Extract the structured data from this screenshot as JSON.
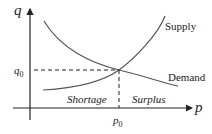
{
  "diagram": {
    "type": "supply-demand",
    "axes": {
      "y_label": "q",
      "x_label": "p"
    },
    "equilibrium": {
      "q_label": "q",
      "q_sub": "0",
      "p_label": "p",
      "p_sub": "0"
    },
    "curves": [
      {
        "name": "Supply"
      },
      {
        "name": "Demand"
      }
    ],
    "regions": {
      "left": "Shortage",
      "right": "Surplus"
    },
    "colors": {
      "axis": "#222222",
      "curve": "#555555"
    }
  }
}
